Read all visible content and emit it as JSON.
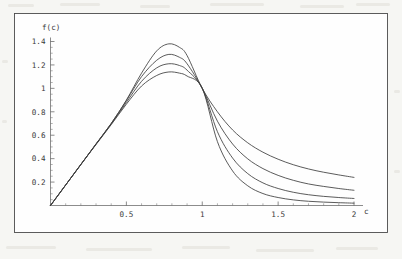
{
  "figure": {
    "background_color": "#f6f6f3",
    "plot_background_color": "#fefefe",
    "frame_color": "#4a4a4a",
    "curve_color": "#3d3d3d",
    "axis_color": "#5a5a5a",
    "y_axis_label": "f(c)",
    "x_axis_label": "c"
  },
  "chart_data": {
    "type": "line",
    "title": "",
    "xlabel": "c",
    "ylabel": "f(c)",
    "xlim": [
      0,
      2.08
    ],
    "ylim": [
      0,
      1.46
    ],
    "grid": false,
    "legend": null,
    "x_ticks": [
      0.5,
      1,
      1.5,
      2
    ],
    "x_tick_labels": [
      "0.5",
      "1",
      "1.5",
      "2"
    ],
    "y_ticks": [
      0.2,
      0.4,
      0.6,
      0.8,
      1,
      1.2,
      1.4
    ],
    "y_tick_labels": [
      "0.2",
      "0.4",
      "0.6",
      "0.8",
      "1",
      "1.2",
      "1.4"
    ],
    "minor_x_ticks": [
      0.1,
      0.2,
      0.3,
      0.4,
      0.6,
      0.7,
      0.8,
      0.9,
      1.1,
      1.2,
      1.3,
      1.4,
      1.6,
      1.7,
      1.8,
      1.9
    ],
    "minor_y_ticks": [
      0.05,
      0.1,
      0.15,
      0.25,
      0.3,
      0.35,
      0.45,
      0.5,
      0.55,
      0.65,
      0.7,
      0.75,
      0.85,
      0.9,
      0.95,
      1.05,
      1.1,
      1.15,
      1.25,
      1.3,
      1.35
    ],
    "common_points": [
      [
        0,
        0
      ],
      [
        1,
        1
      ]
    ],
    "series": [
      {
        "name": "curve-1",
        "peak_x": 0.78,
        "peak_y": 1.38,
        "end_y_at_2": 0.24,
        "x": [
          0,
          0.1,
          0.2,
          0.3,
          0.4,
          0.5,
          0.6,
          0.7,
          0.78,
          0.85,
          0.9,
          1.0,
          1.1,
          1.2,
          1.3,
          1.4,
          1.5,
          1.6,
          1.7,
          1.8,
          1.9,
          2.0
        ],
        "values": [
          0,
          0.175,
          0.35,
          0.525,
          0.7,
          0.9,
          1.13,
          1.32,
          1.38,
          1.35,
          1.28,
          1.0,
          0.8,
          0.645,
          0.535,
          0.455,
          0.395,
          0.348,
          0.312,
          0.284,
          0.261,
          0.24
        ]
      },
      {
        "name": "curve-2",
        "peak_x": 0.78,
        "peak_y": 1.29,
        "end_y_at_2": 0.13,
        "x": [
          0,
          0.1,
          0.2,
          0.3,
          0.4,
          0.5,
          0.6,
          0.7,
          0.78,
          0.85,
          0.9,
          1.0,
          1.1,
          1.2,
          1.3,
          1.4,
          1.5,
          1.6,
          1.7,
          1.8,
          1.9,
          2.0
        ],
        "values": [
          0,
          0.175,
          0.35,
          0.525,
          0.7,
          0.895,
          1.1,
          1.24,
          1.29,
          1.265,
          1.21,
          1.0,
          0.72,
          0.525,
          0.398,
          0.315,
          0.257,
          0.215,
          0.184,
          0.163,
          0.145,
          0.13
        ]
      },
      {
        "name": "curve-3",
        "peak_x": 0.78,
        "peak_y": 1.21,
        "end_y_at_2": 0.06,
        "x": [
          0,
          0.1,
          0.2,
          0.3,
          0.4,
          0.5,
          0.6,
          0.7,
          0.78,
          0.85,
          0.9,
          1.0,
          1.1,
          1.2,
          1.3,
          1.4,
          1.5,
          1.6,
          1.7,
          1.8,
          1.9,
          2.0
        ],
        "values": [
          0,
          0.175,
          0.35,
          0.525,
          0.695,
          0.88,
          1.06,
          1.175,
          1.21,
          1.195,
          1.155,
          1.0,
          0.63,
          0.405,
          0.272,
          0.193,
          0.145,
          0.113,
          0.092,
          0.078,
          0.068,
          0.06
        ]
      },
      {
        "name": "curve-4",
        "peak_x": 0.78,
        "peak_y": 1.14,
        "end_y_at_2": 0.02,
        "x": [
          0,
          0.1,
          0.2,
          0.3,
          0.4,
          0.5,
          0.6,
          0.7,
          0.78,
          0.85,
          0.9,
          1.0,
          1.1,
          1.2,
          1.3,
          1.4,
          1.5,
          1.6,
          1.7,
          1.8,
          1.9,
          2.0
        ],
        "values": [
          0,
          0.175,
          0.35,
          0.52,
          0.69,
          0.865,
          1.02,
          1.11,
          1.14,
          1.13,
          1.105,
          1.0,
          0.545,
          0.295,
          0.168,
          0.102,
          0.068,
          0.048,
          0.036,
          0.029,
          0.024,
          0.02
        ]
      }
    ]
  }
}
